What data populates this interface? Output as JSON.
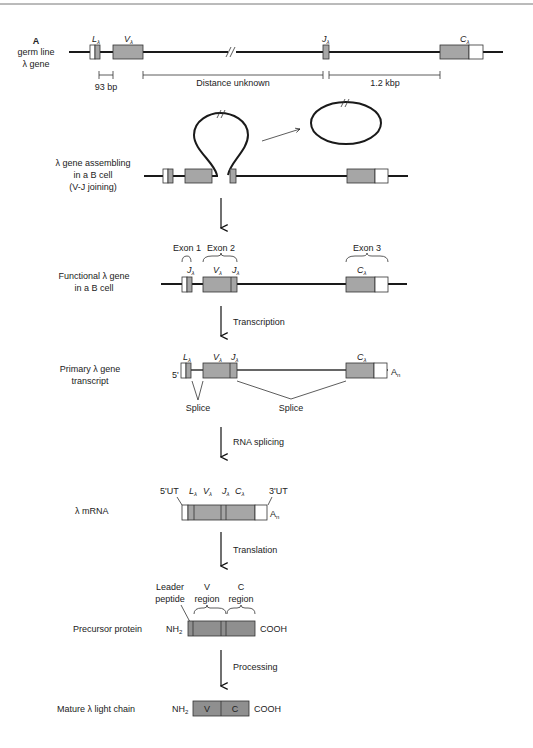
{
  "figure": {
    "panel_label": "A",
    "colors": {
      "exon_fill": "#a6a6a6",
      "protein_fill": "#8f8f8f",
      "utr_fill": "#ffffff",
      "line": "#1a1a1a"
    }
  },
  "rows": {
    "germline": {
      "label_lines": [
        "germ line",
        "λ gene"
      ],
      "segments": {
        "L": "L",
        "V": "V",
        "J": "J",
        "C": "C",
        "sub": "λ"
      },
      "distances": {
        "lv": "93 bp",
        "vj": "Distance unknown",
        "jc": "1.2 kbp"
      }
    },
    "assembling": {
      "label_lines": [
        "λ gene assembling",
        "in a B cell",
        "(V-J joining)"
      ]
    },
    "functional": {
      "label_lines": [
        "Functional λ gene",
        "in a B cell"
      ],
      "exons": [
        "Exon 1",
        "Exon 2",
        "Exon 3"
      ],
      "segments": {
        "J1": "J",
        "V": "V",
        "J2": "J",
        "C": "C",
        "sub": "λ"
      }
    },
    "primary": {
      "label_lines": [
        "Primary λ gene",
        "transcript"
      ],
      "five_prime": "5'",
      "polyA": "A",
      "polyA_sub": "n",
      "splice_labels": [
        "Splice",
        "Splice"
      ],
      "segments": {
        "L": "L",
        "V": "V",
        "J": "J",
        "C": "C",
        "sub": "λ"
      }
    },
    "mrna": {
      "label": "λ mRNA",
      "five_ut": "5'UT",
      "three_ut": "3'UT",
      "polyA": "A",
      "polyA_sub": "n",
      "segments": {
        "L": "L",
        "V": "V",
        "J": "J",
        "C": "C",
        "sub": "λ"
      }
    },
    "precursor": {
      "label": "Precursor protein",
      "nh2": "NH",
      "nh2_sub": "2",
      "cooh": "COOH",
      "regions": {
        "leader": [
          "Leader",
          "peptide"
        ],
        "v": [
          "V",
          "region"
        ],
        "c": [
          "C",
          "region"
        ]
      }
    },
    "mature": {
      "label": "Mature λ light chain",
      "nh2": "NH",
      "nh2_sub": "2",
      "cooh": "COOH",
      "v": "V",
      "c": "C"
    }
  },
  "steps": {
    "transcription": "Transcription",
    "rna_splicing": "RNA splicing",
    "translation": "Translation",
    "processing": "Processing"
  }
}
